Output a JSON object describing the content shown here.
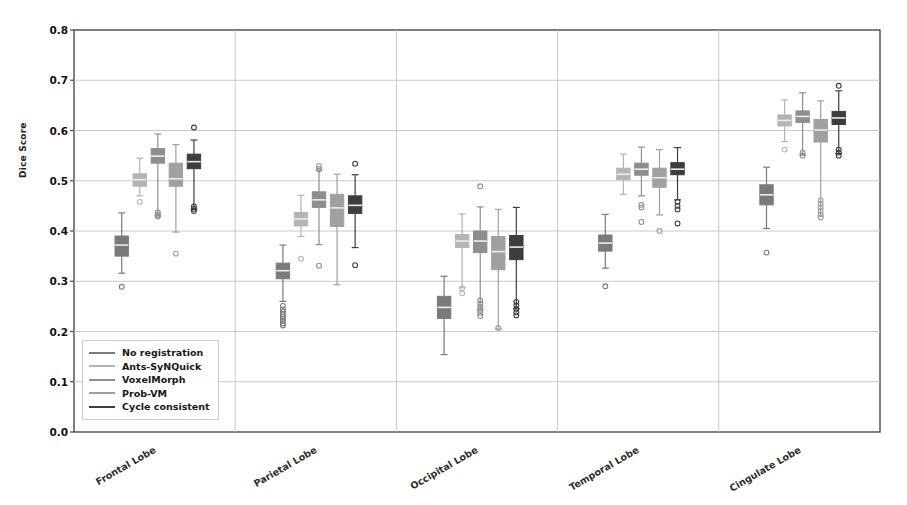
{
  "chart_data": {
    "type": "box",
    "title": "",
    "xlabel": "",
    "ylabel": "Dice Score",
    "ylim": [
      0.0,
      0.8
    ],
    "yticks": [
      "0.0",
      "0.1",
      "0.2",
      "0.3",
      "0.4",
      "0.5",
      "0.6",
      "0.7",
      "0.8"
    ],
    "grid": true,
    "legend_position": "lower left",
    "categories": [
      "Frontal Lobe",
      "Parietal Lobe",
      "Occipital Lobe",
      "Temporal Lobe",
      "Cingulate Lobe"
    ],
    "series": [
      {
        "name": "No registration",
        "color": "#7a7a7a"
      },
      {
        "name": "Ants-SyNQuick",
        "color": "#b4b4b4"
      },
      {
        "name": "VoxelMorph",
        "color": "#8e8e8e"
      },
      {
        "name": "Prob-VM",
        "color": "#a0a0a0"
      },
      {
        "name": "Cycle consistent",
        "color": "#3d3d3d"
      }
    ],
    "boxes": [
      {
        "category": "Frontal Lobe",
        "series": "No registration",
        "whisker_low": 0.316,
        "q1": 0.35,
        "median": 0.372,
        "q3": 0.39,
        "whisker_high": 0.436,
        "outliers": [
          0.289
        ]
      },
      {
        "category": "Frontal Lobe",
        "series": "Ants-SyNQuick",
        "whisker_low": 0.47,
        "q1": 0.489,
        "median": 0.502,
        "q3": 0.514,
        "whisker_high": 0.545,
        "outliers": [
          0.458
        ]
      },
      {
        "category": "Frontal Lobe",
        "series": "VoxelMorph",
        "whisker_low": 0.43,
        "q1": 0.535,
        "median": 0.549,
        "q3": 0.564,
        "whisker_high": 0.593,
        "outliers": [
          0.437,
          0.432,
          0.429
        ]
      },
      {
        "category": "Frontal Lobe",
        "series": "Prob-VM",
        "whisker_low": 0.398,
        "q1": 0.489,
        "median": 0.504,
        "q3": 0.535,
        "whisker_high": 0.572,
        "outliers": [
          0.355
        ]
      },
      {
        "category": "Frontal Lobe",
        "series": "Cycle consistent",
        "whisker_low": 0.443,
        "q1": 0.524,
        "median": 0.538,
        "q3": 0.553,
        "whisker_high": 0.581,
        "outliers": [
          0.606,
          0.449,
          0.444,
          0.44
        ]
      },
      {
        "category": "Parietal Lobe",
        "series": "No registration",
        "whisker_low": 0.26,
        "q1": 0.305,
        "median": 0.321,
        "q3": 0.336,
        "whisker_high": 0.372,
        "outliers": [
          0.251,
          0.244,
          0.239,
          0.234,
          0.229,
          0.225,
          0.221,
          0.216,
          0.212
        ]
      },
      {
        "category": "Parietal Lobe",
        "series": "Ants-SyNQuick",
        "whisker_low": 0.389,
        "q1": 0.41,
        "median": 0.424,
        "q3": 0.437,
        "whisker_high": 0.471,
        "outliers": [
          0.345
        ]
      },
      {
        "category": "Parietal Lobe",
        "series": "VoxelMorph",
        "whisker_low": 0.373,
        "q1": 0.447,
        "median": 0.462,
        "q3": 0.478,
        "whisker_high": 0.521,
        "outliers": [
          0.529,
          0.523,
          0.331
        ]
      },
      {
        "category": "Parietal Lobe",
        "series": "Prob-VM",
        "whisker_low": 0.293,
        "q1": 0.409,
        "median": 0.446,
        "q3": 0.473,
        "whisker_high": 0.513,
        "outliers": []
      },
      {
        "category": "Parietal Lobe",
        "series": "Cycle consistent",
        "whisker_low": 0.367,
        "q1": 0.435,
        "median": 0.451,
        "q3": 0.47,
        "whisker_high": 0.512,
        "outliers": [
          0.534,
          0.332
        ]
      },
      {
        "category": "Occipital Lobe",
        "series": "No registration",
        "whisker_low": 0.154,
        "q1": 0.226,
        "median": 0.248,
        "q3": 0.27,
        "whisker_high": 0.31,
        "outliers": []
      },
      {
        "category": "Occipital Lobe",
        "series": "Ants-SyNQuick",
        "whisker_low": 0.287,
        "q1": 0.367,
        "median": 0.38,
        "q3": 0.393,
        "whisker_high": 0.434,
        "outliers": [
          0.286,
          0.276
        ]
      },
      {
        "category": "Occipital Lobe",
        "series": "VoxelMorph",
        "whisker_low": 0.243,
        "q1": 0.357,
        "median": 0.38,
        "q3": 0.4,
        "whisker_high": 0.448,
        "outliers": [
          0.489,
          0.262,
          0.255,
          0.249,
          0.243,
          0.237,
          0.231
        ]
      },
      {
        "category": "Occipital Lobe",
        "series": "Prob-VM",
        "whisker_low": 0.205,
        "q1": 0.323,
        "median": 0.359,
        "q3": 0.389,
        "whisker_high": 0.443,
        "outliers": [
          0.207
        ]
      },
      {
        "category": "Occipital Lobe",
        "series": "Cycle consistent",
        "whisker_low": 0.245,
        "q1": 0.343,
        "median": 0.368,
        "q3": 0.391,
        "whisker_high": 0.447,
        "outliers": [
          0.259,
          0.252,
          0.245,
          0.238,
          0.232
        ]
      },
      {
        "category": "Temporal Lobe",
        "series": "No registration",
        "whisker_low": 0.326,
        "q1": 0.36,
        "median": 0.376,
        "q3": 0.392,
        "whisker_high": 0.433,
        "outliers": [
          0.29
        ]
      },
      {
        "category": "Temporal Lobe",
        "series": "Ants-SyNQuick",
        "whisker_low": 0.473,
        "q1": 0.502,
        "median": 0.513,
        "q3": 0.525,
        "whisker_high": 0.553,
        "outliers": []
      },
      {
        "category": "Temporal Lobe",
        "series": "VoxelMorph",
        "whisker_low": 0.47,
        "q1": 0.511,
        "median": 0.523,
        "q3": 0.535,
        "whisker_high": 0.567,
        "outliers": [
          0.452,
          0.447,
          0.418
        ]
      },
      {
        "category": "Temporal Lobe",
        "series": "Prob-VM",
        "whisker_low": 0.432,
        "q1": 0.487,
        "median": 0.506,
        "q3": 0.525,
        "whisker_high": 0.562,
        "outliers": [
          0.4
        ]
      },
      {
        "category": "Temporal Lobe",
        "series": "Cycle consistent",
        "whisker_low": 0.462,
        "q1": 0.512,
        "median": 0.523,
        "q3": 0.536,
        "whisker_high": 0.566,
        "outliers": [
          0.458,
          0.45,
          0.443,
          0.415
        ]
      },
      {
        "category": "Cingulate Lobe",
        "series": "No registration",
        "whisker_low": 0.405,
        "q1": 0.452,
        "median": 0.472,
        "q3": 0.492,
        "whisker_high": 0.527,
        "outliers": [
          0.357
        ]
      },
      {
        "category": "Cingulate Lobe",
        "series": "Ants-SyNQuick",
        "whisker_low": 0.578,
        "q1": 0.609,
        "median": 0.62,
        "q3": 0.631,
        "whisker_high": 0.661,
        "outliers": [
          0.562
        ]
      },
      {
        "category": "Cingulate Lobe",
        "series": "VoxelMorph",
        "whisker_low": 0.551,
        "q1": 0.616,
        "median": 0.628,
        "q3": 0.639,
        "whisker_high": 0.675,
        "outliers": [
          0.556,
          0.55
        ]
      },
      {
        "category": "Cingulate Lobe",
        "series": "Prob-VM",
        "whisker_low": 0.43,
        "q1": 0.577,
        "median": 0.601,
        "q3": 0.622,
        "whisker_high": 0.659,
        "outliers": [
          0.461,
          0.454,
          0.447,
          0.44,
          0.433,
          0.427
        ]
      },
      {
        "category": "Cingulate Lobe",
        "series": "Cycle consistent",
        "whisker_low": 0.554,
        "q1": 0.612,
        "median": 0.625,
        "q3": 0.638,
        "whisker_high": 0.679,
        "outliers": [
          0.689,
          0.562,
          0.556,
          0.55
        ]
      }
    ]
  },
  "legend": {
    "items": [
      {
        "label": "No registration"
      },
      {
        "label": "Ants-SyNQuick"
      },
      {
        "label": "VoxelMorph"
      },
      {
        "label": "Prob-VM"
      },
      {
        "label": "Cycle consistent"
      }
    ]
  }
}
